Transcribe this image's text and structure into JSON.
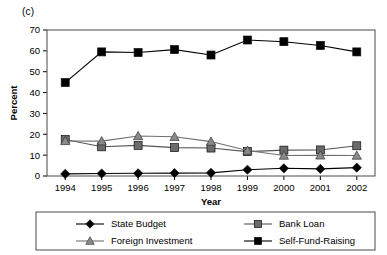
{
  "panel": {
    "label": "(c)"
  },
  "chart_data": {
    "type": "line",
    "title": "",
    "subtitle": "",
    "xlabel": "Year",
    "ylabel": "Percent",
    "categories": [
      "1994",
      "1995",
      "1996",
      "1997",
      "1998",
      "1999",
      "2000",
      "2001",
      "2002"
    ],
    "x": [
      1994,
      1995,
      1996,
      1997,
      1998,
      1999,
      2000,
      2001,
      2002
    ],
    "ylim": [
      0,
      70
    ],
    "yticks": [
      0,
      10,
      20,
      30,
      40,
      50,
      60,
      70
    ],
    "ytick_labels": [
      "0",
      "10",
      "20",
      "30",
      "40",
      "50",
      "60",
      "70"
    ],
    "grid": false,
    "legend_position": "bottom",
    "series": [
      {
        "name": "State Budget",
        "marker": "diamond",
        "color": "#000000",
        "line_color": "#000000",
        "values": [
          1.0,
          1.2,
          1.3,
          1.4,
          1.5,
          3.0,
          3.7,
          3.4,
          4.0
        ]
      },
      {
        "name": "Bank Loan",
        "marker": "square",
        "color": "#6b6b6b",
        "line_color": "#555555",
        "values": [
          17.5,
          14.0,
          14.7,
          13.6,
          13.4,
          11.7,
          12.4,
          12.5,
          14.5
        ]
      },
      {
        "name": "Foreign Investment",
        "marker": "triangle",
        "color": "#8a8a8a",
        "line_color": "#707070",
        "values": [
          16.8,
          16.7,
          19.2,
          18.8,
          16.5,
          12.2,
          9.8,
          9.9,
          9.8
        ]
      },
      {
        "name": "Self-Fund-Raising",
        "marker": "square",
        "color": "#000000",
        "line_color": "#000000",
        "values": [
          44.8,
          59.5,
          59.2,
          60.6,
          58.0,
          65.2,
          64.4,
          62.6,
          59.5
        ]
      }
    ]
  },
  "legend": {
    "entries": [
      {
        "label": "State Budget"
      },
      {
        "label": "Bank Loan"
      },
      {
        "label": "Foreign Investment"
      },
      {
        "label": "Self-Fund-Raising"
      }
    ]
  }
}
